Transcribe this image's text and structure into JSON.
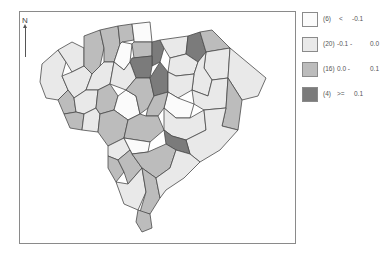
{
  "map": {
    "north_label": "N",
    "region": "South Carolina counties",
    "stroke_color": "#4a4a4a"
  },
  "legend": {
    "classes": [
      {
        "count": "(6)",
        "op": "<",
        "low": "",
        "high": "-0.1",
        "label_a": "<",
        "label_b": "-0.1",
        "color": "#fbfbfb"
      },
      {
        "count": "(20)",
        "low": "-0.1 -",
        "high": "0.0",
        "color": "#e9e9e9"
      },
      {
        "count": "(16)",
        "low": "0.0 -",
        "high": "0.1",
        "color": "#bcbcbc"
      },
      {
        "count": "(4)",
        "low": ">=",
        "high": "0.1",
        "color": "#7b7b7b"
      }
    ]
  },
  "colors": {
    "c0": "#fbfbfb",
    "c1": "#e9e9e9",
    "c2": "#bcbcbc",
    "c3": "#7b7b7b"
  }
}
